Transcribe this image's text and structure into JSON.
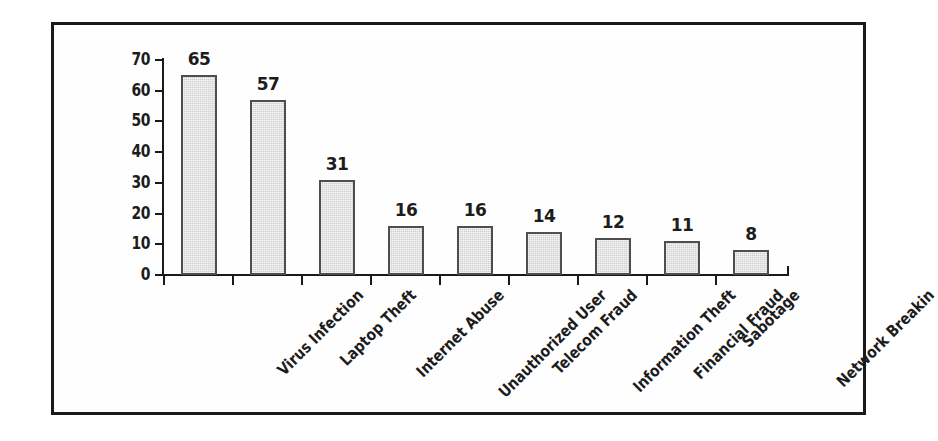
{
  "figure": {
    "frame_border_color": "#1a1a1a",
    "background_color": "#ffffff"
  },
  "chart_data": {
    "type": "bar",
    "title": "",
    "subtitle": "",
    "xlabel": "",
    "ylabel": "",
    "ylim": [
      0,
      70
    ],
    "ytick_values": [
      0,
      10,
      20,
      30,
      40,
      50,
      60,
      70
    ],
    "ytick_labels": [
      "0",
      "10",
      "20",
      "30",
      "40",
      "50",
      "60",
      "70"
    ],
    "grid": false,
    "legend": false,
    "legend_position": "none",
    "orientation": "vertical",
    "bar_fill_color": "#cfcfcf",
    "bar_edge_color": "#4e4e4e",
    "value_labels_shown": true,
    "xtick_label_rotation": -45,
    "categories": [
      "Virus Infection",
      "Laptop Theft",
      "Internet Abuse",
      "Unauthorized User",
      "Telecom Fraud",
      "Information Theft",
      "Financial Fraud",
      "Sabotage",
      "Network Breakin"
    ],
    "values": [
      65,
      57,
      31,
      16,
      16,
      14,
      12,
      11,
      8
    ],
    "value_labels": [
      "65",
      "57",
      "31",
      "16",
      "16",
      "14",
      "12",
      "11",
      "8"
    ]
  }
}
